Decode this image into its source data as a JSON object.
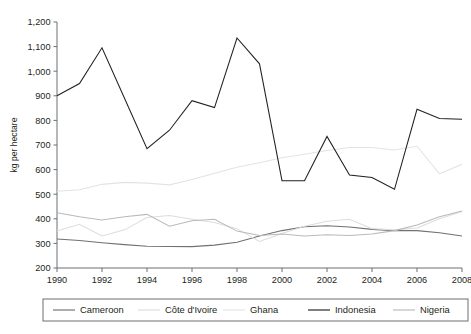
{
  "chart_data": {
    "type": "line",
    "title": "",
    "subtitle": "",
    "xlabel": "",
    "ylabel": "kg per hectare",
    "grid": false,
    "legend_position": "bottom",
    "ylim": [
      200,
      1200
    ],
    "xlim": [
      1990,
      2008
    ],
    "ytick_labels": [
      "200",
      "300",
      "400",
      "500",
      "600",
      "700",
      "800",
      "900",
      "1,000",
      "1,100",
      "1,200"
    ],
    "ytick_values": [
      200,
      300,
      400,
      500,
      600,
      700,
      800,
      900,
      1000,
      1100,
      1200
    ],
    "xtick_labels": [
      "1990",
      "1992",
      "1994",
      "1996",
      "1998",
      "2000",
      "2002",
      "2004",
      "2006",
      "2008"
    ],
    "xtick_values": [
      1990,
      1992,
      1994,
      1996,
      1998,
      2000,
      2002,
      2004,
      2006,
      2008
    ],
    "x": [
      1990,
      1991,
      1992,
      1993,
      1994,
      1995,
      1996,
      1997,
      1998,
      1999,
      2000,
      2001,
      2002,
      2003,
      2004,
      2005,
      2006,
      2007,
      2008
    ],
    "series": [
      {
        "name": "Cameroon",
        "color": "#6f7173",
        "values": [
          318,
          312,
          303,
          295,
          288,
          287,
          287,
          293,
          305,
          330,
          352,
          368,
          372,
          367,
          357,
          352,
          352,
          343,
          330
        ]
      },
      {
        "name": "Côte d'Ivoire",
        "color": "#dcdddf",
        "values": [
          350,
          378,
          330,
          355,
          405,
          413,
          398,
          385,
          360,
          308,
          340,
          370,
          390,
          398,
          360,
          355,
          363,
          400,
          430
        ]
      },
      {
        "name": "Ghana",
        "color": "#e2e3e5",
        "values": [
          512,
          518,
          540,
          548,
          545,
          538,
          560,
          585,
          610,
          628,
          648,
          662,
          678,
          690,
          690,
          680,
          695,
          583,
          622
        ]
      },
      {
        "name": "Indonesia",
        "color": "#231f20",
        "values": [
          900,
          950,
          1095,
          890,
          685,
          760,
          880,
          852,
          1135,
          1030,
          555,
          555,
          735,
          578,
          568,
          520,
          845,
          808,
          805
        ]
      },
      {
        "name": "Nigeria",
        "color": "#b9babc",
        "values": [
          425,
          408,
          395,
          408,
          418,
          370,
          392,
          398,
          350,
          332,
          338,
          330,
          335,
          332,
          338,
          352,
          375,
          408,
          432
        ]
      }
    ]
  },
  "legend": {
    "items": [
      {
        "label": "Cameroon",
        "color": "#6f7173"
      },
      {
        "label": "Côte d'Ivoire",
        "color": "#dcdddf"
      },
      {
        "label": "Ghana",
        "color": "#e2e3e5"
      },
      {
        "label": "Indonesia",
        "color": "#231f20"
      },
      {
        "label": "Nigeria",
        "color": "#b9babc"
      }
    ]
  }
}
